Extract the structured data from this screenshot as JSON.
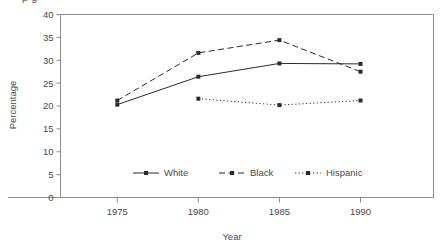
{
  "figure": {
    "cut_title_fragment": "p          g",
    "background_color": "#ffffff",
    "frame_color": "#8c8c8c",
    "series_color": "#2b2b2b"
  },
  "chart_data": {
    "type": "line",
    "title": "",
    "xlabel": "Year",
    "ylabel": "Percentage",
    "x": [
      1975,
      1980,
      1985,
      1990
    ],
    "xtick_labels": [
      "1975",
      "1980",
      "1985",
      "1990"
    ],
    "ytick_labels": [
      "0",
      "5",
      "10",
      "15",
      "20",
      "25",
      "30",
      "35",
      "40"
    ],
    "yticks": [
      0,
      5,
      10,
      15,
      20,
      25,
      30,
      35,
      40
    ],
    "xlim": [
      1971.5,
      1994.5
    ],
    "ylim": [
      0,
      40
    ],
    "grid": false,
    "legend_position": "inside-bottom-center",
    "series": [
      {
        "name": "White",
        "line_style": "solid",
        "marker": "square",
        "values": [
          20.3,
          26.4,
          29.3,
          29.2
        ]
      },
      {
        "name": "Black",
        "line_style": "dashed",
        "marker": "square",
        "values": [
          21.2,
          31.6,
          34.4,
          27.5
        ]
      },
      {
        "name": "Hispanic",
        "line_style": "dotted",
        "marker": "square",
        "values": [
          null,
          21.6,
          20.2,
          21.2
        ]
      }
    ]
  }
}
